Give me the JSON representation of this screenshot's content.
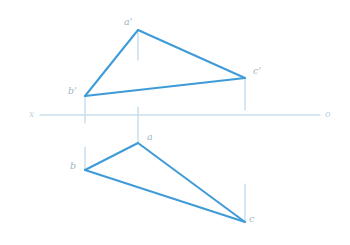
{
  "drawing": {
    "title": "Orthographic projection of triangle ABC",
    "width": 350,
    "height": 245,
    "background": "#ffffff",
    "colors": {
      "triangle_stroke": "#3f9bd8",
      "projector_stroke": "#b3d4e7",
      "axis_stroke": "#c9dfeb",
      "label_text": "#9fb6c4",
      "axis_label_text": "#b9cfdd"
    },
    "stroke_widths": {
      "triangle": 2.0,
      "projector": 1.1,
      "axis": 1.3
    }
  },
  "axis": {
    "name": "ground-line",
    "y": 115,
    "x_start": 40,
    "x_end": 320,
    "left_label": "x",
    "right_label": "o",
    "left_label_pos": {
      "x": 29,
      "y": 110
    },
    "right_label_pos": {
      "x": 325,
      "y": 110
    }
  },
  "front_view": {
    "name": "front-view-triangle",
    "label": "a'b'c'",
    "vertices": [
      {
        "id": "a-prime",
        "label": "a'",
        "x": 138,
        "y": 30,
        "label_x": 124,
        "label_y": 17
      },
      {
        "id": "b-prime",
        "label": "b'",
        "x": 85,
        "y": 96,
        "label_x": 68,
        "label_y": 86
      },
      {
        "id": "c-prime",
        "label": "c'",
        "x": 245,
        "y": 78,
        "label_x": 253,
        "label_y": 66
      }
    ],
    "edges": [
      {
        "from": "a-prime",
        "to": "b-prime"
      },
      {
        "from": "b-prime",
        "to": "c-prime"
      },
      {
        "from": "c-prime",
        "to": "a-prime"
      }
    ]
  },
  "top_view": {
    "name": "top-view-triangle",
    "label": "abc",
    "vertices": [
      {
        "id": "a",
        "label": "a",
        "x": 138,
        "y": 143,
        "label_x": 147,
        "label_y": 132
      },
      {
        "id": "b",
        "label": "b",
        "x": 85,
        "y": 170,
        "label_x": 70,
        "label_y": 161
      },
      {
        "id": "c",
        "label": "c",
        "x": 245,
        "y": 222,
        "label_x": 249,
        "label_y": 214
      }
    ],
    "edges": [
      {
        "from": "a",
        "to": "b"
      },
      {
        "from": "b",
        "to": "c"
      },
      {
        "from": "c",
        "to": "a"
      }
    ]
  },
  "projectors": [
    {
      "id": "proj-a-prime-up",
      "x": 138,
      "y1": 30,
      "y2": 60
    },
    {
      "id": "proj-a-down",
      "x": 138,
      "y1": 107,
      "y2": 143
    },
    {
      "id": "proj-b-prime",
      "x": 85,
      "y1": 96,
      "y2": 123
    },
    {
      "id": "proj-b",
      "x": 85,
      "y1": 147,
      "y2": 170
    },
    {
      "id": "proj-c-prime",
      "x": 245,
      "y1": 78,
      "y2": 110
    },
    {
      "id": "proj-c",
      "x": 245,
      "y1": 184,
      "y2": 222
    }
  ]
}
